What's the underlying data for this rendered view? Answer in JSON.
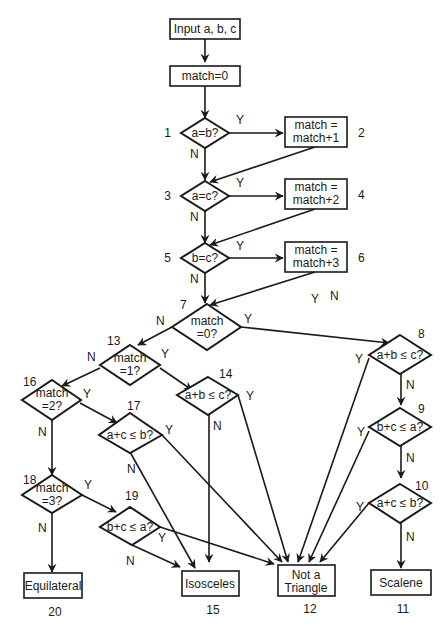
{
  "diagram": {
    "type": "flowchart",
    "nodes": {
      "input": {
        "text": "Input a, b, c"
      },
      "init": {
        "text": "match=0"
      },
      "d1": {
        "text": "a=b?",
        "num": "1"
      },
      "p2": {
        "line1": "match =",
        "line2": "match+1",
        "num": "2"
      },
      "d3": {
        "text": "a=c?",
        "num": "3"
      },
      "p4": {
        "line1": "match =",
        "line2": "match+2",
        "num": "4"
      },
      "d5": {
        "text": "b=c?",
        "num": "5"
      },
      "p6": {
        "line1": "match =",
        "line2": "match+3",
        "num": "6"
      },
      "d7": {
        "line1": "match",
        "line2": "=0?",
        "num": "7"
      },
      "d8": {
        "text": "a+b ≤ c?",
        "num": "8"
      },
      "d9": {
        "text": "b+c ≤ a?",
        "num": "9"
      },
      "d10": {
        "text": "a+c ≤ b?",
        "num": "10"
      },
      "t11": {
        "text": "Scalene",
        "num": "11"
      },
      "t12": {
        "line1": "Not a",
        "line2": "Triangle",
        "num": "12"
      },
      "d13": {
        "line1": "match",
        "line2": "=1?",
        "num": "13"
      },
      "d14": {
        "text": "a+b ≤ c?",
        "num": "14"
      },
      "t15": {
        "text": "Isosceles",
        "num": "15"
      },
      "d16": {
        "line1": "match",
        "line2": "=2?",
        "num": "16"
      },
      "d17": {
        "text": "a+c ≤ b?",
        "num": "17"
      },
      "d18": {
        "line1": "match",
        "line2": "=3?",
        "num": "18"
      },
      "d19": {
        "text": "b+c ≤ a?",
        "num": "19"
      },
      "t20": {
        "text": "Equilateral",
        "num": "20"
      }
    },
    "labels": {
      "yes": "Y",
      "no": "N"
    },
    "stray_labels": {
      "y": "Y",
      "n": "N"
    }
  }
}
